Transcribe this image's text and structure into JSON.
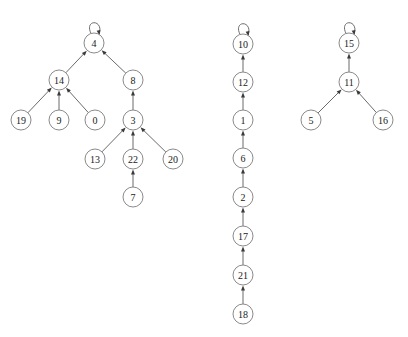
{
  "diagram": {
    "title": "",
    "type": "directed-graph-forest",
    "background_color": "#ffffff",
    "node_fill_color": "#ffffff",
    "node_stroke_color": "#8a8a8a",
    "edge_color": "#6b6b6b",
    "arrow_color": "#3a3a3a",
    "label_color": "#1a1a1a",
    "node_radius": 10,
    "components": [
      {
        "name": "component-left",
        "root": "4"
      },
      {
        "name": "component-middle",
        "root": "10"
      },
      {
        "name": "component-right",
        "root": "15"
      }
    ],
    "nodes": [
      {
        "id": "n4",
        "label": "4",
        "x": 94,
        "y": 43,
        "component": "component-left",
        "self_loop": true
      },
      {
        "id": "n14",
        "label": "14",
        "x": 59,
        "y": 80,
        "component": "component-left",
        "self_loop": false
      },
      {
        "id": "n8",
        "label": "8",
        "x": 133,
        "y": 80,
        "component": "component-left",
        "self_loop": false
      },
      {
        "id": "n19",
        "label": "19",
        "x": 21,
        "y": 120,
        "component": "component-left",
        "self_loop": false
      },
      {
        "id": "n9",
        "label": "9",
        "x": 59,
        "y": 120,
        "component": "component-left",
        "self_loop": false
      },
      {
        "id": "n0",
        "label": "0",
        "x": 95,
        "y": 120,
        "component": "component-left",
        "self_loop": false
      },
      {
        "id": "n3",
        "label": "3",
        "x": 133,
        "y": 120,
        "component": "component-left",
        "self_loop": false
      },
      {
        "id": "n13",
        "label": "13",
        "x": 95,
        "y": 159,
        "component": "component-left",
        "self_loop": false
      },
      {
        "id": "n22",
        "label": "22",
        "x": 133,
        "y": 159,
        "component": "component-left",
        "self_loop": false
      },
      {
        "id": "n20",
        "label": "20",
        "x": 173,
        "y": 159,
        "component": "component-left",
        "self_loop": false
      },
      {
        "id": "n7",
        "label": "7",
        "x": 133,
        "y": 197,
        "component": "component-left",
        "self_loop": false
      },
      {
        "id": "n10",
        "label": "10",
        "x": 243,
        "y": 44,
        "component": "component-middle",
        "self_loop": true
      },
      {
        "id": "n12",
        "label": "12",
        "x": 243,
        "y": 82,
        "component": "component-middle",
        "self_loop": false
      },
      {
        "id": "n1",
        "label": "1",
        "x": 243,
        "y": 120,
        "component": "component-middle",
        "self_loop": false
      },
      {
        "id": "n6",
        "label": "6",
        "x": 243,
        "y": 158,
        "component": "component-middle",
        "self_loop": false
      },
      {
        "id": "n2",
        "label": "2",
        "x": 243,
        "y": 197,
        "component": "component-middle",
        "self_loop": false
      },
      {
        "id": "n17",
        "label": "17",
        "x": 243,
        "y": 236,
        "component": "component-middle",
        "self_loop": false
      },
      {
        "id": "n21",
        "label": "21",
        "x": 243,
        "y": 275,
        "component": "component-middle",
        "self_loop": false
      },
      {
        "id": "n18",
        "label": "18",
        "x": 243,
        "y": 314,
        "component": "component-middle",
        "self_loop": false
      },
      {
        "id": "n15",
        "label": "15",
        "x": 349,
        "y": 43,
        "component": "component-right",
        "self_loop": true
      },
      {
        "id": "n11",
        "label": "11",
        "x": 349,
        "y": 82,
        "component": "component-right",
        "self_loop": false
      },
      {
        "id": "n5",
        "label": "5",
        "x": 311,
        "y": 120,
        "component": "component-right",
        "self_loop": false
      },
      {
        "id": "n16",
        "label": "16",
        "x": 383,
        "y": 120,
        "component": "component-right",
        "self_loop": false
      }
    ],
    "edges": [
      {
        "from": "n14",
        "to": "n4"
      },
      {
        "from": "n8",
        "to": "n4"
      },
      {
        "from": "n19",
        "to": "n14"
      },
      {
        "from": "n9",
        "to": "n14"
      },
      {
        "from": "n0",
        "to": "n14"
      },
      {
        "from": "n3",
        "to": "n8"
      },
      {
        "from": "n13",
        "to": "n3"
      },
      {
        "from": "n22",
        "to": "n3"
      },
      {
        "from": "n20",
        "to": "n3"
      },
      {
        "from": "n7",
        "to": "n22"
      },
      {
        "from": "n12",
        "to": "n10"
      },
      {
        "from": "n1",
        "to": "n12"
      },
      {
        "from": "n6",
        "to": "n1"
      },
      {
        "from": "n2",
        "to": "n6"
      },
      {
        "from": "n17",
        "to": "n2"
      },
      {
        "from": "n21",
        "to": "n17"
      },
      {
        "from": "n18",
        "to": "n21"
      },
      {
        "from": "n11",
        "to": "n15"
      },
      {
        "from": "n5",
        "to": "n11"
      },
      {
        "from": "n16",
        "to": "n11"
      }
    ]
  }
}
